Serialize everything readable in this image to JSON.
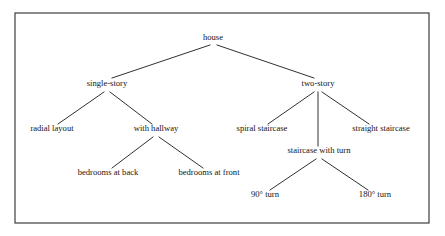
{
  "diagram": {
    "type": "taxonomy-tree",
    "title": "house",
    "orientation": "top-down",
    "frame": {
      "x": 15,
      "y": 13,
      "width": 414,
      "height": 210,
      "stroke_color": "#3c3c3c"
    },
    "style": {
      "edge_color": "#1a1a1a",
      "text_color": "#141414",
      "background": "#ffffff",
      "font_size_px": 8.6
    },
    "nodes": [
      {
        "id": "house",
        "label": "house",
        "x": 213,
        "y": 40,
        "level": 0,
        "parent": null
      },
      {
        "id": "single-story",
        "label": "single-story",
        "x": 107,
        "y": 86,
        "level": 1,
        "parent": "house"
      },
      {
        "id": "two-story",
        "label": "two-story",
        "x": 318,
        "y": 86,
        "level": 1,
        "parent": "house"
      },
      {
        "id": "radial-layout",
        "label": "radial layout",
        "x": 52,
        "y": 131,
        "level": 2,
        "parent": "single-story"
      },
      {
        "id": "with-hallway",
        "label": "with hallway",
        "x": 156,
        "y": 131,
        "level": 2,
        "parent": "single-story"
      },
      {
        "id": "spiral-staircase",
        "label": "spiral staircase",
        "x": 262,
        "y": 131,
        "level": 2,
        "parent": "two-story"
      },
      {
        "id": "staircase-with-turn",
        "label": "staircase with turn",
        "x": 319,
        "y": 153,
        "level": 2,
        "parent": "two-story"
      },
      {
        "id": "straight-staircase",
        "label": "straight staircase",
        "x": 381,
        "y": 131,
        "level": 2,
        "parent": "two-story"
      },
      {
        "id": "bedrooms-at-back",
        "label": "bedrooms at back",
        "x": 108,
        "y": 175,
        "level": 3,
        "parent": "with-hallway"
      },
      {
        "id": "bedrooms-at-front",
        "label": "bedrooms at front",
        "x": 209,
        "y": 175,
        "level": 3,
        "parent": "with-hallway"
      },
      {
        "id": "turn-90",
        "label": "90° turn",
        "x": 265,
        "y": 197,
        "level": 3,
        "parent": "staircase-with-turn"
      },
      {
        "id": "turn-180",
        "label": "180° turn",
        "x": 375,
        "y": 197,
        "level": 3,
        "parent": "staircase-with-turn"
      }
    ],
    "edges": [
      {
        "from": "house",
        "to": "single-story",
        "x1": 210,
        "y1": 45,
        "x2": 112,
        "y2": 78
      },
      {
        "from": "house",
        "to": "two-story",
        "x1": 217,
        "y1": 45,
        "x2": 314,
        "y2": 78
      },
      {
        "from": "single-story",
        "to": "radial-layout",
        "x1": 104,
        "y1": 92,
        "x2": 58,
        "y2": 124
      },
      {
        "from": "single-story",
        "to": "with-hallway",
        "x1": 110,
        "y1": 92,
        "x2": 152,
        "y2": 124
      },
      {
        "from": "two-story",
        "to": "spiral-staircase",
        "x1": 314,
        "y1": 92,
        "x2": 268,
        "y2": 124
      },
      {
        "from": "two-story",
        "to": "staircase-with-turn",
        "x1": 318,
        "y1": 92,
        "x2": 318,
        "y2": 146
      },
      {
        "from": "two-story",
        "to": "straight-staircase",
        "x1": 322,
        "y1": 92,
        "x2": 369,
        "y2": 124
      },
      {
        "from": "with-hallway",
        "to": "bedrooms-at-back",
        "x1": 153,
        "y1": 137,
        "x2": 112,
        "y2": 168
      },
      {
        "from": "with-hallway",
        "to": "bedrooms-at-front",
        "x1": 159,
        "y1": 137,
        "x2": 203,
        "y2": 168
      },
      {
        "from": "staircase-with-turn",
        "to": "turn-90",
        "x1": 316,
        "y1": 159,
        "x2": 270,
        "y2": 190
      },
      {
        "from": "staircase-with-turn",
        "to": "turn-180",
        "x1": 322,
        "y1": 159,
        "x2": 368,
        "y2": 190
      }
    ]
  }
}
